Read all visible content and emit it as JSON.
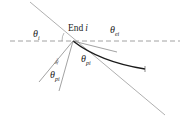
{
  "diagram": {
    "colors": {
      "thin_line": "#9a9a9a",
      "dashed_line": "#8a8a8a",
      "curve": "#1a1a1a",
      "text": "#222222"
    },
    "labels": {
      "end": "End",
      "end_index": "i",
      "theta": "θ",
      "theta_i_sub": "i",
      "theta_ei_sub": "ei",
      "theta_pi_sub": "pi",
      "right_angle": "90°"
    }
  }
}
